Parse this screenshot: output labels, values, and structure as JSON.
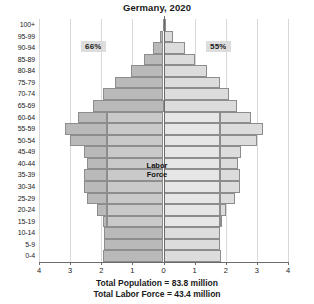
{
  "chart_data": {
    "type": "bar",
    "chart_subtype": "population-pyramid",
    "title": "Germany, 2020",
    "xlabel": "",
    "ylabel": "",
    "xlim": [
      -4,
      4
    ],
    "xticks": [
      "4",
      "3",
      "2",
      "1",
      "0",
      "1",
      "2",
      "3",
      "4"
    ],
    "xtick_values": [
      -4,
      -3,
      -2,
      -1,
      0,
      1,
      2,
      3,
      4
    ],
    "grid": true,
    "legend": "none",
    "axis_unit": "millions",
    "categories": [
      "100+",
      "95-99",
      "90-94",
      "85-89",
      "80-84",
      "75-79",
      "70-74",
      "65-69",
      "60-64",
      "55-59",
      "50-54",
      "45-49",
      "40-44",
      "35-39",
      "30-34",
      "25-29",
      "20-24",
      "15-19",
      "10-14",
      "5-9",
      "0-4"
    ],
    "series": [
      {
        "name": "Male",
        "side": "left",
        "color": "#b9b9b9",
        "values": [
          0.02,
          0.12,
          0.35,
          0.62,
          1.05,
          1.55,
          1.95,
          2.25,
          2.75,
          3.15,
          3.0,
          2.55,
          2.45,
          2.55,
          2.55,
          2.45,
          2.15,
          1.95,
          1.9,
          1.9,
          1.95
        ]
      },
      {
        "name": "Female",
        "side": "right",
        "color": "#dcdcdc",
        "values": [
          0.06,
          0.3,
          0.7,
          1.0,
          1.4,
          1.8,
          2.1,
          2.35,
          2.8,
          3.2,
          3.0,
          2.5,
          2.4,
          2.45,
          2.45,
          2.3,
          2.0,
          1.85,
          1.8,
          1.8,
          1.85
        ]
      }
    ],
    "labor_force": {
      "name": "Labor Force",
      "label": "Labor Force",
      "age_range": [
        "15-19",
        "60-64"
      ],
      "left_inner": [
        0,
        0,
        0,
        0,
        0,
        0,
        0,
        0,
        1.8,
        1.8,
        1.8,
        1.8,
        1.8,
        1.8,
        1.8,
        1.8,
        1.8,
        1.8,
        0,
        0,
        0
      ],
      "right_inner": [
        0,
        0,
        0,
        0,
        0,
        0,
        0,
        0,
        1.8,
        1.8,
        1.8,
        1.8,
        1.8,
        1.8,
        1.8,
        1.8,
        1.8,
        1.8,
        0,
        0,
        0
      ]
    },
    "annotations": [
      {
        "name": "left-share",
        "text": "66%",
        "side": "left"
      },
      {
        "name": "right-share",
        "text": "55%",
        "side": "right"
      }
    ],
    "footnotes": [
      "Total Population = 83.8 million",
      "Total Labor Force = 43.4 million"
    ],
    "colors": {
      "left_outer": "#b9b9b9",
      "left_inner": "#c9c9c9",
      "right_outer": "#dcdcdc",
      "right_inner": "#e6e6e6",
      "bar_border": "#8d8d8d",
      "grid": "#d8d8d8",
      "axis": "#6b6b6b",
      "annotation_bg": "#dddddd"
    }
  }
}
